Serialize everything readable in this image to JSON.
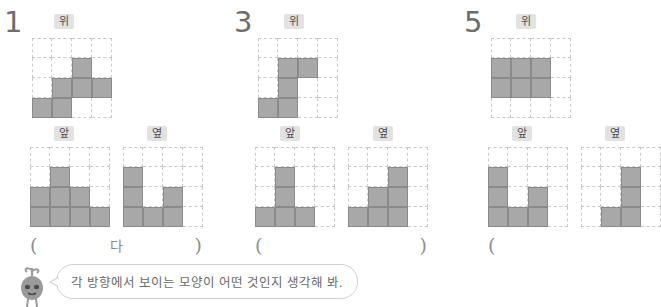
{
  "labels": {
    "top": "위",
    "front": "앞",
    "side": "옆",
    "paren_open": "(",
    "paren_close": ")"
  },
  "hint": {
    "text": "각 방향에서 보이는 모양이 어떤 것인지 생각해 봐.",
    "mascot": "sprout-character"
  },
  "colors": {
    "fill": "#a8a8a8",
    "fill_border": "#8a8a8a",
    "grid_line": "#c9c9c9",
    "chip_bg": "#e2e2e2",
    "number": "#6d6d6d",
    "text": "#6a6a6a"
  },
  "problems": [
    {
      "number": "1",
      "answer": "다",
      "answer_close_visible": true,
      "top": {
        "label": "위",
        "rows": 4,
        "cols": 4,
        "filled": [
          [
            1,
            2
          ],
          [
            2,
            1
          ],
          [
            2,
            2
          ],
          [
            2,
            3
          ],
          [
            3,
            0
          ],
          [
            3,
            1
          ]
        ]
      },
      "front": {
        "label": "앞",
        "rows": 4,
        "cols": 4,
        "filled": [
          [
            1,
            1
          ],
          [
            2,
            0
          ],
          [
            2,
            1
          ],
          [
            2,
            2
          ],
          [
            3,
            0
          ],
          [
            3,
            1
          ],
          [
            3,
            2
          ],
          [
            3,
            3
          ]
        ]
      },
      "side": {
        "label": "옆",
        "rows": 4,
        "cols": 4,
        "filled": [
          [
            1,
            0
          ],
          [
            2,
            0
          ],
          [
            2,
            2
          ],
          [
            3,
            0
          ],
          [
            3,
            1
          ],
          [
            3,
            2
          ]
        ]
      }
    },
    {
      "number": "3",
      "answer": "",
      "answer_close_visible": true,
      "top": {
        "label": "위",
        "rows": 4,
        "cols": 4,
        "filled": [
          [
            1,
            1
          ],
          [
            1,
            2
          ],
          [
            2,
            1
          ],
          [
            3,
            0
          ],
          [
            3,
            1
          ]
        ]
      },
      "front": {
        "label": "앞",
        "rows": 4,
        "cols": 4,
        "filled": [
          [
            1,
            1
          ],
          [
            2,
            1
          ],
          [
            3,
            0
          ],
          [
            3,
            1
          ],
          [
            3,
            2
          ]
        ]
      },
      "side": {
        "label": "옆",
        "rows": 4,
        "cols": 4,
        "filled": [
          [
            1,
            2
          ],
          [
            2,
            1
          ],
          [
            2,
            2
          ],
          [
            3,
            0
          ],
          [
            3,
            1
          ],
          [
            3,
            2
          ]
        ]
      }
    },
    {
      "number": "5",
      "answer": "",
      "answer_close_visible": false,
      "top": {
        "label": "위",
        "rows": 4,
        "cols": 4,
        "filled": [
          [
            1,
            0
          ],
          [
            1,
            1
          ],
          [
            1,
            2
          ],
          [
            2,
            0
          ],
          [
            2,
            1
          ],
          [
            2,
            2
          ]
        ]
      },
      "front": {
        "label": "앞",
        "rows": 4,
        "cols": 4,
        "filled": [
          [
            1,
            0
          ],
          [
            2,
            0
          ],
          [
            2,
            2
          ],
          [
            3,
            0
          ],
          [
            3,
            1
          ],
          [
            3,
            2
          ]
        ]
      },
      "side": {
        "label": "옆",
        "rows": 4,
        "cols": 4,
        "filled": [
          [
            1,
            2
          ],
          [
            2,
            2
          ],
          [
            3,
            1
          ],
          [
            3,
            2
          ]
        ]
      }
    }
  ]
}
